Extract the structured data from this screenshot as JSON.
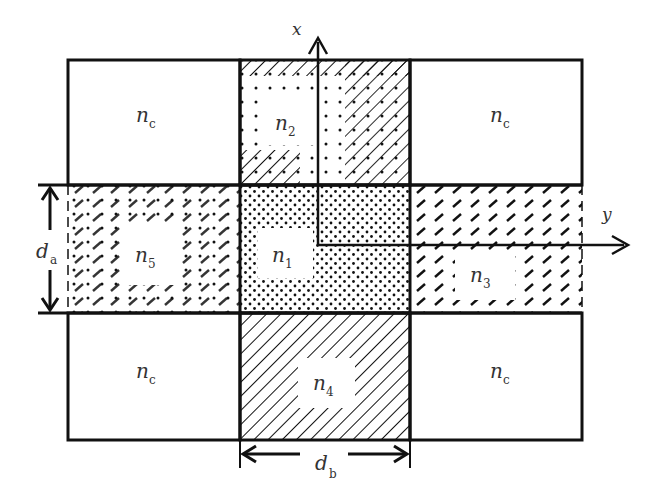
{
  "diagram": {
    "type": "waveguide cross-section (Marcatili-type rectangular core)",
    "regions": [
      {
        "id": "n1",
        "symbol": "n",
        "subscript": "1",
        "position": "center",
        "pattern": "dots"
      },
      {
        "id": "n2",
        "symbol": "n",
        "subscript": "2",
        "position": "top",
        "pattern": "dots + hatch"
      },
      {
        "id": "n3",
        "symbol": "n",
        "subscript": "3",
        "position": "right",
        "pattern": "dashed hatch"
      },
      {
        "id": "n4",
        "symbol": "n",
        "subscript": "4",
        "position": "bottom",
        "pattern": "diagonal hatch"
      },
      {
        "id": "n5",
        "symbol": "n",
        "subscript": "5",
        "position": "left",
        "pattern": "dots + dashed hatch"
      },
      {
        "id": "nc_tl",
        "symbol": "n",
        "subscript": "c",
        "position": "top-left",
        "pattern": "none"
      },
      {
        "id": "nc_tr",
        "symbol": "n",
        "subscript": "c",
        "position": "top-right",
        "pattern": "none"
      },
      {
        "id": "nc_bl",
        "symbol": "n",
        "subscript": "c",
        "position": "bottom-left",
        "pattern": "none"
      },
      {
        "id": "nc_br",
        "symbol": "n",
        "subscript": "c",
        "position": "bottom-right",
        "pattern": "none"
      }
    ],
    "axes": {
      "x": {
        "symbol": "x",
        "direction": "up"
      },
      "y": {
        "symbol": "y",
        "direction": "right"
      }
    },
    "dimensions": {
      "da": {
        "symbol": "d",
        "subscript": "a",
        "orientation": "vertical"
      },
      "db": {
        "symbol": "d",
        "subscript": "b",
        "orientation": "horizontal"
      }
    },
    "colors": {
      "stroke": "#111111",
      "text": "#333333",
      "background": "#ffffff"
    }
  }
}
